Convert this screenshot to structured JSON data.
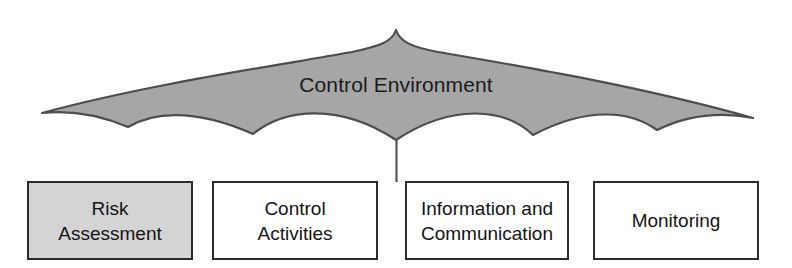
{
  "diagram": {
    "title": "Control Environment",
    "canopy": {
      "label": "Control Environment",
      "fill_color": "#a6a6a6",
      "stroke_color": "#4d4d4d"
    },
    "handle": {
      "name": "umbrella-handle",
      "color": "#555555"
    },
    "components": [
      {
        "id": "risk-assessment",
        "label": "Risk\nAssessment",
        "shaded": true,
        "fill_color": "#d4d4d4",
        "border_color": "#2b2b2b"
      },
      {
        "id": "control-activities",
        "label": "Control\nActivities",
        "shaded": false,
        "fill_color": "#ffffff",
        "border_color": "#2b2b2b"
      },
      {
        "id": "information-and-communication",
        "label": "Information and\nCommunication",
        "shaded": false,
        "fill_color": "#ffffff",
        "border_color": "#2b2b2b"
      },
      {
        "id": "monitoring",
        "label": "Monitoring",
        "shaded": false,
        "fill_color": "#ffffff",
        "border_color": "#2b2b2b"
      }
    ]
  }
}
